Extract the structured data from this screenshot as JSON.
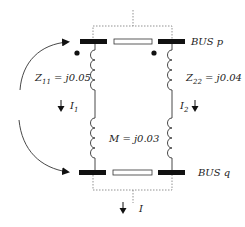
{
  "diagram": {
    "type": "mutually coupled branches between two buses",
    "buses": [
      {
        "id": "p",
        "label": "BUS p"
      },
      {
        "id": "q",
        "label": "BUS q"
      }
    ],
    "branches": [
      {
        "id": "left",
        "impedance_name": "Z",
        "impedance_sub": "11",
        "impedance_value": "= j0.05",
        "current_name": "I",
        "current_sub": "1"
      },
      {
        "id": "right",
        "impedance_name": "Z",
        "impedance_sub": "22",
        "impedance_value": "= j0.04",
        "current_name": "I",
        "current_sub": "2"
      }
    ],
    "mutual": {
      "label": "M = j0.03"
    },
    "injection_current": {
      "label": "I"
    },
    "colors": {
      "line": "#333333",
      "bus": "#111111",
      "dashed": "#777777",
      "background": "#ffffff"
    }
  }
}
